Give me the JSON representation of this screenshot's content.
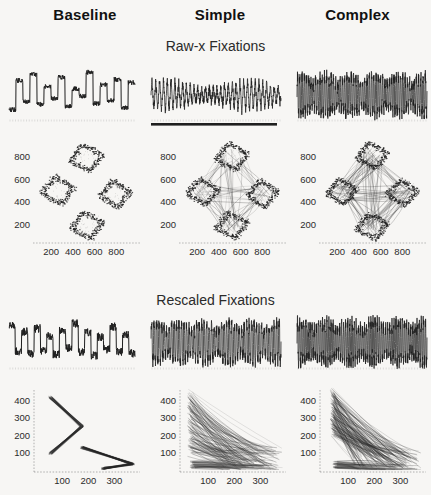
{
  "figure": {
    "background_color": "#f7f6f4",
    "ink_color": "#1f1f1f"
  },
  "columns": [
    {
      "id": "baseline",
      "label": "Baseline"
    },
    {
      "id": "simple",
      "label": "Simple"
    },
    {
      "id": "complex",
      "label": "Complex"
    }
  ],
  "sections": [
    {
      "id": "raw",
      "title": "Raw-x Fixations"
    },
    {
      "id": "rescaled",
      "title": "Rescaled Fixations"
    }
  ],
  "chart_data": [
    {
      "id": "raw-trace-baseline",
      "type": "line",
      "section": "raw",
      "column": "baseline",
      "title": "",
      "xlabel": "",
      "ylabel": "",
      "xlim": [
        0,
        1000
      ],
      "ylim": [
        0,
        100
      ],
      "grid": false,
      "legend": "none",
      "note": "Raw horizontal eye position over time: slow square-wave steps between four discrete levels with noisy plateaus",
      "series": [
        {
          "name": "raw-x",
          "style": "step-noisy",
          "levels": [
            18,
            74,
            34,
            86,
            28,
            62,
            40,
            80,
            24,
            58,
            44,
            90,
            30,
            66,
            36,
            76,
            22,
            70
          ],
          "noise": 9,
          "segments": 18,
          "samples_per_segment": 26
        }
      ]
    },
    {
      "id": "raw-trace-simple",
      "type": "line",
      "section": "raw",
      "column": "simple",
      "title": "",
      "xlabel": "",
      "ylabel": "",
      "xlim": [
        0,
        1000
      ],
      "ylim": [
        0,
        100
      ],
      "grid": false,
      "legend": "none",
      "baseline_bar": true,
      "note": "Dense oscillating sawtooth with solid dark baseline bar beneath",
      "series": [
        {
          "name": "raw-x",
          "style": "oscillating",
          "cycles": 34,
          "amplitude": 62,
          "offset": 46,
          "noise": 16,
          "samples": 900
        }
      ]
    },
    {
      "id": "raw-trace-complex",
      "type": "line",
      "section": "raw",
      "column": "complex",
      "title": "",
      "xlabel": "",
      "ylabel": "",
      "xlim": [
        0,
        1000
      ],
      "ylim": [
        0,
        100
      ],
      "grid": false,
      "legend": "none",
      "note": "Very dense high frequency spiking of variable amplitude",
      "series": [
        {
          "name": "raw-x",
          "style": "spiky",
          "cycles": 58,
          "amplitude": 74,
          "offset": 46,
          "noise": 24,
          "samples": 1100
        }
      ]
    },
    {
      "id": "raw-scatter-baseline",
      "type": "scatter",
      "section": "raw",
      "column": "baseline",
      "title": "",
      "xlabel": "",
      "ylabel": "",
      "xticks": [
        200,
        400,
        600,
        800
      ],
      "yticks": [
        200,
        400,
        600,
        800
      ],
      "xlim": [
        60,
        1000
      ],
      "ylim": [
        60,
        950
      ],
      "grid": false,
      "legend": "none",
      "note": "Four separated diamond-shaped fixation clusters in a cross arrangement, no connecting paths",
      "clusters": [
        {
          "cx": 520,
          "cy": 790,
          "rx": 150,
          "ry": 120,
          "rot": 12
        },
        {
          "cx": 260,
          "cy": 500,
          "rx": 150,
          "ry": 125,
          "rot": 10
        },
        {
          "cx": 790,
          "cy": 470,
          "rx": 140,
          "ry": 120,
          "rot": 8
        },
        {
          "cx": 530,
          "cy": 190,
          "rx": 150,
          "ry": 120,
          "rot": 14
        }
      ],
      "connections": []
    },
    {
      "id": "raw-scatter-simple",
      "type": "scatter",
      "section": "raw",
      "column": "simple",
      "title": "",
      "xlabel": "",
      "ylabel": "",
      "xticks": [
        200,
        400,
        600,
        800
      ],
      "yticks": [
        200,
        400,
        600,
        800
      ],
      "xlim": [
        60,
        1000
      ],
      "ylim": [
        60,
        950
      ],
      "grid": false,
      "legend": "none",
      "note": "Four clusters joined by a diamond web of saccade trajectories",
      "clusters": [
        {
          "cx": 520,
          "cy": 800,
          "rx": 150,
          "ry": 120,
          "rot": 12
        },
        {
          "cx": 250,
          "cy": 490,
          "rx": 145,
          "ry": 115,
          "rot": 10
        },
        {
          "cx": 800,
          "cy": 470,
          "rx": 140,
          "ry": 120,
          "rot": 8
        },
        {
          "cx": 520,
          "cy": 190,
          "rx": 150,
          "ry": 115,
          "rot": 14
        }
      ],
      "connections": [
        [
          0,
          1
        ],
        [
          1,
          3
        ],
        [
          3,
          2
        ],
        [
          2,
          0
        ],
        [
          0,
          3
        ],
        [
          1,
          2
        ]
      ],
      "connection_density": 26
    },
    {
      "id": "raw-scatter-complex",
      "type": "scatter",
      "section": "raw",
      "column": "complex",
      "title": "",
      "xlabel": "",
      "ylabel": "",
      "xticks": [
        200,
        400,
        600,
        800
      ],
      "yticks": [
        200,
        400,
        600,
        800
      ],
      "xlim": [
        60,
        1000
      ],
      "ylim": [
        60,
        950
      ],
      "grid": false,
      "legend": "none",
      "note": "Densest web: all node pairs connected including both diagonals",
      "clusters": [
        {
          "cx": 520,
          "cy": 810,
          "rx": 145,
          "ry": 115,
          "rot": 12
        },
        {
          "cx": 240,
          "cy": 490,
          "rx": 140,
          "ry": 115,
          "rot": 10
        },
        {
          "cx": 800,
          "cy": 480,
          "rx": 140,
          "ry": 115,
          "rot": 8
        },
        {
          "cx": 520,
          "cy": 180,
          "rx": 145,
          "ry": 115,
          "rot": 14
        }
      ],
      "connections": [
        [
          0,
          1
        ],
        [
          1,
          3
        ],
        [
          3,
          2
        ],
        [
          2,
          0
        ],
        [
          0,
          3
        ],
        [
          1,
          2
        ],
        [
          0,
          1
        ],
        [
          2,
          3
        ]
      ],
      "connection_density": 42
    },
    {
      "id": "rescaled-trace-baseline",
      "type": "line",
      "section": "rescaled",
      "column": "baseline",
      "title": "",
      "xlabel": "",
      "ylabel": "",
      "xlim": [
        0,
        1000
      ],
      "ylim": [
        0,
        100
      ],
      "grid": false,
      "legend": "none",
      "note": "Rescaled trace: blocky square-wave transitions, denser than raw-x",
      "series": [
        {
          "name": "rescaled-x",
          "style": "step-noisy",
          "levels": [
            80,
            30,
            68,
            26,
            74,
            32,
            60,
            24,
            70,
            36,
            84,
            28,
            66,
            22,
            58,
            34,
            78,
            30,
            62,
            26
          ],
          "noise": 16,
          "segments": 20,
          "samples_per_segment": 22
        }
      ]
    },
    {
      "id": "rescaled-trace-simple",
      "type": "line",
      "section": "rescaled",
      "column": "simple",
      "title": "",
      "xlabel": "",
      "ylabel": "",
      "xlim": [
        0,
        1000
      ],
      "ylim": [
        0,
        100
      ],
      "grid": false,
      "legend": "none",
      "note": "Dense vertical spikes filling the full plot height",
      "series": [
        {
          "name": "rescaled-x",
          "style": "spiky",
          "cycles": 52,
          "amplitude": 78,
          "offset": 48,
          "noise": 22,
          "samples": 1050
        }
      ]
    },
    {
      "id": "rescaled-trace-complex",
      "type": "line",
      "section": "rescaled",
      "column": "complex",
      "title": "",
      "xlabel": "",
      "ylabel": "",
      "xlim": [
        0,
        1000
      ],
      "ylim": [
        0,
        100
      ],
      "grid": false,
      "legend": "none",
      "note": "Saturated high-frequency spiking across the whole trace",
      "series": [
        {
          "name": "rescaled-x",
          "style": "spiky",
          "cycles": 62,
          "amplitude": 80,
          "offset": 48,
          "noise": 26,
          "samples": 1200
        }
      ]
    },
    {
      "id": "rescaled-scatter-baseline",
      "type": "scatter",
      "section": "rescaled",
      "column": "baseline",
      "title": "",
      "xlabel": "",
      "ylabel": "",
      "xticks": [
        100,
        200,
        300
      ],
      "yticks": [
        100,
        200,
        300,
        400
      ],
      "xlim": [
        0,
        390
      ],
      "ylim": [
        0,
        460
      ],
      "grid": false,
      "legend": "none",
      "note": "Two separate chevron / V-shaped trajectory bundles, sparse",
      "fan": {
        "style": "chevrons",
        "chevrons": [
          {
            "apex_x": 175,
            "apex_y": 250,
            "ax": 55,
            "ay": 420,
            "bx": 55,
            "by": 95
          },
          {
            "apex_x": 370,
            "apex_y": 35,
            "ax": 175,
            "ay": 130,
            "bx": 255,
            "by": 10
          }
        ],
        "lines": 34,
        "jitter": 14
      }
    },
    {
      "id": "rescaled-scatter-simple",
      "type": "scatter",
      "section": "rescaled",
      "column": "simple",
      "title": "",
      "xlabel": "",
      "ylabel": "",
      "xticks": [
        100,
        200,
        300
      ],
      "yticks": [
        100,
        200,
        300,
        400
      ],
      "xlim": [
        0,
        390
      ],
      "ylim": [
        0,
        460
      ],
      "grid": false,
      "legend": "none",
      "note": "Dense fan of trajectories radiating from upper-left down to lower-right",
      "fan": {
        "style": "fan",
        "origin_x": 30,
        "origin_spread_y": [
          90,
          450
        ],
        "end_x_range": [
          150,
          385
        ],
        "end_y_range": [
          10,
          130
        ],
        "lines": 115,
        "jitter": 20,
        "sag": 40
      }
    },
    {
      "id": "rescaled-scatter-complex",
      "type": "scatter",
      "section": "rescaled",
      "column": "complex",
      "title": "",
      "xlabel": "",
      "ylabel": "",
      "xticks": [
        100,
        200,
        300
      ],
      "yticks": [
        100,
        200,
        300,
        400
      ],
      "xlim": [
        0,
        390
      ],
      "ylim": [
        0,
        460
      ],
      "grid": false,
      "legend": "none",
      "note": "Densest triangular fan converging at a sharp apex top-left",
      "fan": {
        "style": "fan",
        "origin_x": 40,
        "origin_spread_y": [
          200,
          460
        ],
        "end_x_range": [
          120,
          380
        ],
        "end_y_range": [
          5,
          110
        ],
        "lines": 150,
        "jitter": 16,
        "sag": 30
      }
    }
  ]
}
